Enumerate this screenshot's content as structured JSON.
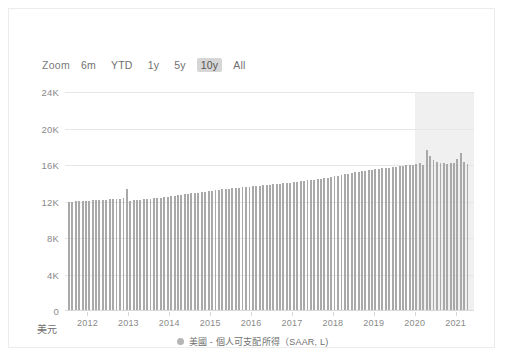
{
  "range_selector": {
    "label": "Zoom",
    "options": [
      {
        "label": "6m",
        "selected": false
      },
      {
        "label": "YTD",
        "selected": false
      },
      {
        "label": "1y",
        "selected": false
      },
      {
        "label": "5y",
        "selected": false
      },
      {
        "label": "10y",
        "selected": true
      },
      {
        "label": "All",
        "selected": false
      }
    ]
  },
  "axis_unit": "美元",
  "legend": {
    "marker_color": "#b5b5b5",
    "text": "美國 - 個人可支配所得（SAAR, L)"
  },
  "colors": {
    "bar": "#a9a9a9",
    "gridline": "#e6e6e6",
    "highlight_band": "#ebebeb",
    "selected_button": "#d6d6d6",
    "tick_text": "#8a8a8a",
    "card_border": "#ececec"
  },
  "chart_data": {
    "type": "bar",
    "title": "",
    "xlabel": "",
    "ylabel": "美元",
    "ylim": [
      0,
      24000
    ],
    "yticks": [
      0,
      4000,
      8000,
      12000,
      16000,
      20000,
      24000
    ],
    "ytick_labels": [
      "0",
      "4K",
      "8K",
      "12K",
      "16K",
      "20K",
      "24K"
    ],
    "xticks": [
      2012,
      2013,
      2014,
      2015,
      2016,
      2017,
      2018,
      2019,
      2020,
      2021
    ],
    "xtick_labels": [
      "2012",
      "2013",
      "2014",
      "2015",
      "2016",
      "2017",
      "2018",
      "2019",
      "2020",
      "2021"
    ],
    "xlim": [
      2011.45,
      2021.45
    ],
    "grid": true,
    "legend_position": "bottom-center",
    "highlight_band": {
      "x_start": 2020.0,
      "x_end": 2021.45
    },
    "series": [
      {
        "name": "美國 - 個人可支配所得（SAAR, L)",
        "color": "#a9a9a9",
        "x": [
          2011.54,
          2011.63,
          2011.71,
          2011.79,
          2011.88,
          2011.96,
          2012.04,
          2012.13,
          2012.21,
          2012.29,
          2012.38,
          2012.46,
          2012.54,
          2012.63,
          2012.71,
          2012.79,
          2012.88,
          2012.96,
          2013.04,
          2013.13,
          2013.21,
          2013.29,
          2013.38,
          2013.46,
          2013.54,
          2013.63,
          2013.71,
          2013.79,
          2013.88,
          2013.96,
          2014.04,
          2014.13,
          2014.21,
          2014.29,
          2014.38,
          2014.46,
          2014.54,
          2014.63,
          2014.71,
          2014.79,
          2014.88,
          2014.96,
          2015.04,
          2015.13,
          2015.21,
          2015.29,
          2015.38,
          2015.46,
          2015.54,
          2015.63,
          2015.71,
          2015.79,
          2015.88,
          2015.96,
          2016.04,
          2016.13,
          2016.21,
          2016.29,
          2016.38,
          2016.46,
          2016.54,
          2016.63,
          2016.71,
          2016.79,
          2016.88,
          2016.96,
          2017.04,
          2017.13,
          2017.21,
          2017.29,
          2017.38,
          2017.46,
          2017.54,
          2017.63,
          2017.71,
          2017.79,
          2017.88,
          2017.96,
          2018.04,
          2018.13,
          2018.21,
          2018.29,
          2018.38,
          2018.46,
          2018.54,
          2018.63,
          2018.71,
          2018.79,
          2018.88,
          2018.96,
          2019.04,
          2019.13,
          2019.21,
          2019.29,
          2019.38,
          2019.46,
          2019.54,
          2019.63,
          2019.71,
          2019.79,
          2019.88,
          2019.96,
          2020.04,
          2020.13,
          2020.21,
          2020.29,
          2020.38,
          2020.46,
          2020.54,
          2020.63,
          2020.71,
          2020.79,
          2020.88,
          2020.96,
          2021.04,
          2021.13,
          2021.21,
          2021.29
        ],
        "values": [
          11960,
          11985,
          12005,
          12030,
          12055,
          12075,
          12105,
          12135,
          12155,
          12175,
          12190,
          12210,
          12235,
          12260,
          12285,
          12320,
          12360,
          13320,
          12080,
          12130,
          12175,
          12215,
          12250,
          12290,
          12325,
          12360,
          12400,
          12440,
          12480,
          12520,
          12565,
          12610,
          12665,
          12720,
          12775,
          12830,
          12880,
          12930,
          12985,
          13040,
          13090,
          13145,
          13200,
          13255,
          13300,
          13340,
          13380,
          13420,
          13455,
          13490,
          13525,
          13560,
          13590,
          13620,
          13655,
          13690,
          13725,
          13760,
          13795,
          13830,
          13870,
          13905,
          13945,
          13985,
          14020,
          14060,
          14110,
          14160,
          14210,
          14260,
          14310,
          14360,
          14410,
          14460,
          14510,
          14560,
          14610,
          14665,
          14760,
          14850,
          14930,
          15000,
          15070,
          15140,
          15200,
          15260,
          15320,
          15375,
          15425,
          15470,
          15520,
          15575,
          15630,
          15680,
          15725,
          15775,
          15820,
          15870,
          15915,
          15960,
          16005,
          16055,
          16120,
          16170,
          15970,
          17700,
          16940,
          16560,
          16330,
          16250,
          16180,
          16140,
          16180,
          16240,
          16700,
          17350,
          16380,
          16100
        ]
      }
    ]
  }
}
